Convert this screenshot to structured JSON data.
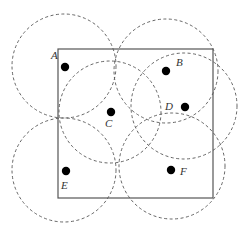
{
  "diagram": {
    "square": {
      "x": 58,
      "y": 49,
      "width": 155,
      "height": 149,
      "stroke": "#555555"
    },
    "circle_style": {
      "stroke": "#555555",
      "dash": "3,2.5"
    },
    "dot_color": "#000000",
    "nodes": [
      {
        "label": "A",
        "cx": 64,
        "cy": 66,
        "r": 52,
        "dot": [
          65,
          67
        ],
        "label_pos": [
          51,
          59
        ]
      },
      {
        "label": "B",
        "cx": 166,
        "cy": 71,
        "r": 52,
        "dot": [
          166,
          71
        ],
        "label_pos": [
          176,
          66
        ]
      },
      {
        "label": "C",
        "cx": 110,
        "cy": 112,
        "r": 51,
        "dot": [
          111,
          112
        ],
        "label_pos": [
          105,
          127
        ]
      },
      {
        "label": "D",
        "cx": 184,
        "cy": 106,
        "r": 53,
        "dot": [
          185,
          107
        ],
        "label_pos": [
          165,
          110
        ]
      },
      {
        "label": "E",
        "cx": 64,
        "cy": 170,
        "r": 52,
        "dot": [
          66,
          171
        ],
        "label_pos": [
          61,
          189
        ]
      },
      {
        "label": "F",
        "cx": 172,
        "cy": 166,
        "r": 53,
        "dot": [
          171,
          170
        ],
        "label_pos": [
          180,
          175
        ]
      }
    ]
  }
}
